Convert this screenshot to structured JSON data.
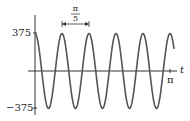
{
  "chart_data": {
    "type": "line",
    "title": "",
    "function": "375 cos(10t)",
    "xlabel": "t",
    "ylabel": "",
    "xlim": [
      0,
      3.14159
    ],
    "ylim": [
      -375,
      375
    ],
    "y_tick_labels": [
      "375",
      "-375"
    ],
    "x_tick_labels": [
      "π"
    ],
    "annotation": {
      "label_num": "π",
      "label_den": "5",
      "meaning": "period"
    },
    "series": [
      {
        "name": "curve",
        "amplitude": 375,
        "period": "π/5",
        "cycles": 5
      }
    ],
    "grid": false,
    "color": "#555555"
  },
  "labels": {
    "y_top": "375",
    "y_bottom": "−375",
    "x_end": "π",
    "x_axis": "t",
    "period_num": "π",
    "period_den": "5"
  }
}
